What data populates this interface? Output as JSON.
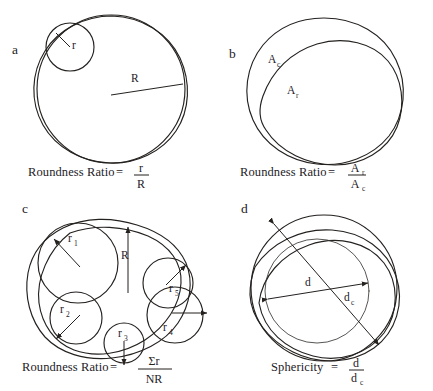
{
  "figure": {
    "type": "line-diagram",
    "background_color": "#ffffff",
    "ink_color": "#24211f"
  },
  "panels": [
    {
      "id": "a",
      "letter": "a",
      "labels": [
        {
          "name": "inscribed-corner-radius",
          "text": "r"
        },
        {
          "name": "circumscribed-radius",
          "text": "R"
        }
      ],
      "caption": {
        "text": "Roundness Ratio",
        "equals": "=",
        "numerator": "r",
        "denominator": "R"
      }
    },
    {
      "id": "b",
      "letter": "b",
      "labels": [
        {
          "name": "circle-area",
          "text": "A",
          "subscript": "c"
        },
        {
          "name": "real-area",
          "text": "A",
          "subscript": "r"
        }
      ],
      "caption": {
        "text": "Roundness Ratio",
        "equals": "=",
        "numerator": "A",
        "numerator_sub": "r",
        "denominator": "A",
        "denominator_sub": "c"
      }
    },
    {
      "id": "c",
      "letter": "c",
      "labels": [
        {
          "name": "corner-radius-1",
          "text": "r",
          "subscript": "1"
        },
        {
          "name": "corner-radius-2",
          "text": "r",
          "subscript": "2"
        },
        {
          "name": "corner-radius-3",
          "text": "r",
          "subscript": "3"
        },
        {
          "name": "corner-radius-4",
          "text": "r",
          "subscript": "4"
        },
        {
          "name": "corner-radius-5",
          "text": "r",
          "subscript": "5"
        },
        {
          "name": "inscribed-circle-radius",
          "text": "R"
        }
      ],
      "caption": {
        "text": "Roundness Ratio",
        "equals": "=",
        "numerator": "Σr",
        "denominator": "NR"
      }
    },
    {
      "id": "d",
      "letter": "d",
      "labels": [
        {
          "name": "inscribed-diameter",
          "text": "d"
        },
        {
          "name": "circumscribed-diameter",
          "text": "d",
          "subscript": "c"
        }
      ],
      "caption": {
        "text": "Sphericity",
        "equals": "=",
        "numerator": "d",
        "denominator": "d",
        "denominator_sub": "c"
      }
    }
  ]
}
